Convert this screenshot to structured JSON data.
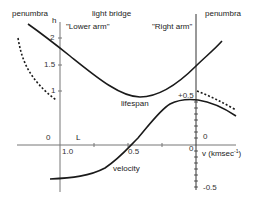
{
  "labels": {
    "penumbra_left": "penumbra",
    "light_bridge": "light bridge",
    "penumbra_right": "penumbra",
    "lower_arm": "\"Lower arm\"",
    "right_arm": "\"Right arm\"",
    "h_axis": "h",
    "lifespan": "lifespan",
    "velocity": "velocity",
    "L": "L",
    "v_axis_prefix": "v (kmsec",
    "v_axis_sup": "-1",
    "v_axis_suffix": ")"
  },
  "left_axis_ticks": [
    "2",
    "1.5",
    "1"
  ],
  "bottom_ticks": {
    "zero_left": "0",
    "one": "1.0",
    "half": "0.5",
    "zero_right": "0"
  },
  "right_axis_ticks": {
    "plus_half": "+0.5",
    "zero": "0",
    "minus_half": "-0.5"
  },
  "colors": {
    "curve": "#1a1a1a",
    "axis": "#777777"
  }
}
